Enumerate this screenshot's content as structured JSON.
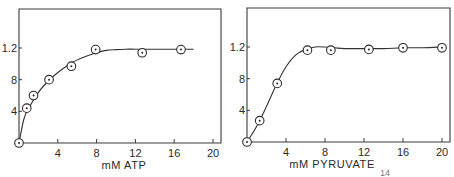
{
  "chart_data": [
    {
      "type": "scatter",
      "title": "",
      "xlabel": "mM ATP",
      "ylabel": "",
      "xlim": [
        0,
        20
      ],
      "ylim": [
        0,
        1.6
      ],
      "xticks": [
        4,
        8,
        12,
        16,
        20
      ],
      "xtick_labels": [
        "4",
        "8",
        "12",
        "16",
        "20"
      ],
      "yticks": [
        0.4,
        0.8,
        1.2
      ],
      "ytick_labels": [
        "4",
        "8",
        "1.2"
      ],
      "grid": false,
      "legend": null,
      "series": [
        {
          "name": "data",
          "marker": "circle-dot",
          "x": [
            0,
            0.8,
            1.5,
            3.1,
            5.4,
            7.9,
            12.7,
            16.7
          ],
          "y": [
            0.0,
            0.44,
            0.6,
            0.8,
            0.97,
            1.18,
            1.14,
            1.18
          ]
        }
      ],
      "fit_curve": {
        "x": [
          0,
          0.5,
          1,
          2,
          3,
          4,
          5,
          6,
          7,
          8,
          9,
          10,
          11,
          12,
          14,
          16,
          18
        ],
        "y": [
          0.0,
          0.3,
          0.44,
          0.64,
          0.78,
          0.89,
          0.98,
          1.05,
          1.1,
          1.14,
          1.17,
          1.18,
          1.185,
          1.185,
          1.185,
          1.185,
          1.185
        ]
      }
    },
    {
      "type": "scatter",
      "title": "",
      "xlabel": "mM PYRUVATE",
      "ylabel": "",
      "xlim": [
        0,
        20
      ],
      "ylim": [
        0,
        1.6
      ],
      "xticks": [
        4,
        8,
        12,
        16,
        20
      ],
      "xtick_labels": [
        "4",
        "8",
        "12",
        "16",
        "20"
      ],
      "yticks": [
        0.4,
        0.8,
        1.2
      ],
      "ytick_labels": [
        "4",
        "8",
        "1.2"
      ],
      "grid": false,
      "legend": null,
      "series": [
        {
          "name": "data",
          "marker": "circle-dot",
          "x": [
            0,
            1.3,
            3.1,
            6.2,
            8.6,
            12.5,
            16.0,
            20.0
          ],
          "y": [
            0.0,
            0.27,
            0.74,
            1.16,
            1.16,
            1.17,
            1.19,
            1.19
          ]
        }
      ],
      "fit_curve": {
        "x": [
          0,
          1,
          2,
          3,
          4,
          5,
          6,
          7,
          8,
          9,
          10,
          12,
          14,
          16,
          18,
          20
        ],
        "y": [
          0.0,
          0.2,
          0.45,
          0.72,
          0.95,
          1.1,
          1.17,
          1.2,
          1.2,
          1.19,
          1.18,
          1.18,
          1.18,
          1.19,
          1.19,
          1.2
        ]
      }
    }
  ],
  "footnote": "14"
}
